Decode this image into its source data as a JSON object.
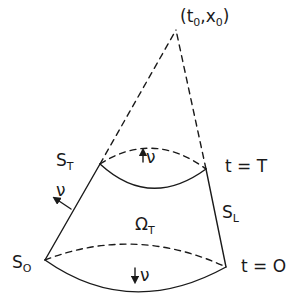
{
  "diagram": {
    "type": "truncated-cone-domain",
    "apex_label": {
      "text": "(t",
      "sub0": "0",
      "sep": ",x",
      "sub1": "0",
      "close": ")"
    },
    "labels": {
      "top_surface": {
        "base": "S",
        "sub": "T"
      },
      "bottom_surface": {
        "base": "S",
        "sub": "O"
      },
      "lateral_surface": {
        "base": "S",
        "sub": "L"
      },
      "domain": {
        "base": "Ω",
        "sub": "T"
      },
      "time_top": "t = T",
      "time_bottom": "t = O",
      "normal_top": "ν",
      "normal_bottom": "ν",
      "normal_lateral": "ν"
    },
    "colors": {
      "ink": "#1a1a1a",
      "background": "#ffffff"
    }
  }
}
